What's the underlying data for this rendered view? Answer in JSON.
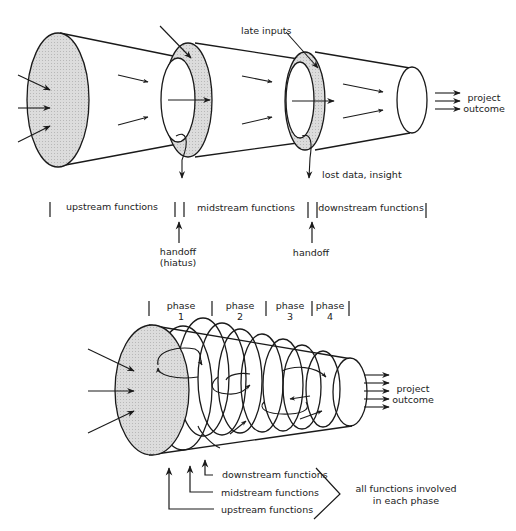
{
  "top_diagram": {
    "labels": {
      "late_inputs": "late inputs",
      "lost_data": "lost data, insight",
      "outcome_line1": "project",
      "outcome_line2": "outcome"
    },
    "timeline": {
      "upstream": "upstream functions",
      "midstream": "midstream functions",
      "downstream": "downstream functions",
      "handoff1_line1": "handoff",
      "handoff1_line2": "(hiatus)",
      "handoff2": "handoff"
    }
  },
  "bottom_diagram": {
    "phases": [
      {
        "label": "phase",
        "number": "1"
      },
      {
        "label": "phase",
        "number": "2"
      },
      {
        "label": "phase",
        "number": "3"
      },
      {
        "label": "phase",
        "number": "4"
      }
    ],
    "outcome_line1": "project",
    "outcome_line2": "outcome",
    "legend": {
      "downstream": "downstream functions",
      "midstream": "midstream functions",
      "upstream": "upstream functions",
      "summary_line1": "all functions involved",
      "summary_line2": "in each phase"
    }
  },
  "colors": {
    "stroke": "#1a1a1a",
    "fill_shaded": "#d4d4d4",
    "background": "#ffffff"
  }
}
